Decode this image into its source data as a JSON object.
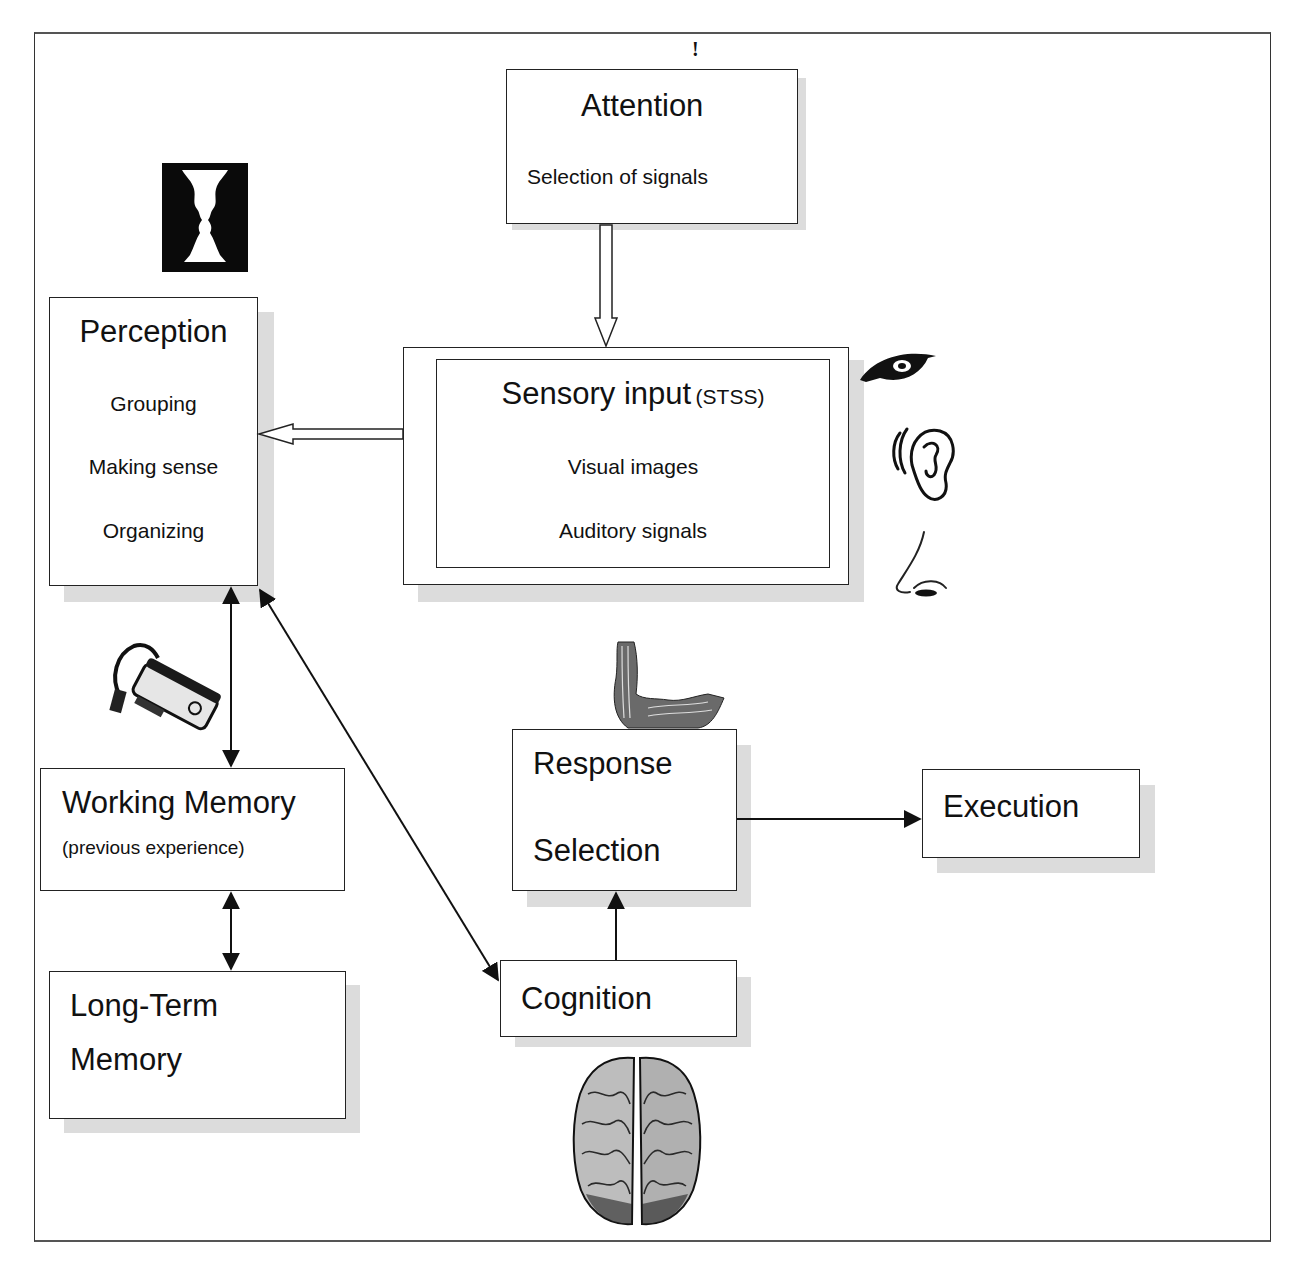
{
  "diagram": {
    "marker": "!",
    "nodes": {
      "attention": {
        "title": "Attention",
        "lines": [
          "Selection of signals"
        ]
      },
      "perception": {
        "title": "Perception",
        "lines": [
          "Grouping",
          "Making sense",
          "Organizing"
        ]
      },
      "sensory_input": {
        "title": "Sensory input",
        "title_suffix": "(STSS)",
        "lines": [
          "Visual images",
          "Auditory signals"
        ]
      },
      "working_memory": {
        "title": "Working Memory",
        "lines": [
          "(previous experience)"
        ]
      },
      "long_term_memory": {
        "title_lines": [
          "Long-Term",
          "Memory"
        ]
      },
      "response_selection": {
        "title_lines": [
          "Response",
          "Selection"
        ]
      },
      "execution": {
        "title": "Execution"
      },
      "cognition": {
        "title": "Cognition"
      }
    },
    "edges": [
      {
        "from": "attention",
        "to": "sensory_input",
        "style": "hollow-arrow"
      },
      {
        "from": "sensory_input",
        "to": "perception",
        "style": "hollow-arrow"
      },
      {
        "from": "perception",
        "to": "working_memory",
        "style": "double-headed"
      },
      {
        "from": "working_memory",
        "to": "long_term_memory",
        "style": "double-headed"
      },
      {
        "from": "perception",
        "to": "cognition",
        "style": "double-headed"
      },
      {
        "from": "cognition",
        "to": "response_selection",
        "style": "arrow"
      },
      {
        "from": "response_selection",
        "to": "execution",
        "style": "arrow"
      }
    ],
    "images": [
      {
        "name": "rubin-vase-faces",
        "near": "perception"
      },
      {
        "name": "eye",
        "near": "sensory_input"
      },
      {
        "name": "ear",
        "near": "sensory_input"
      },
      {
        "name": "nose",
        "near": "sensory_input"
      },
      {
        "name": "usb-card-reader",
        "near": "working_memory"
      },
      {
        "name": "flexed-arm-muscle",
        "near": "response_selection"
      },
      {
        "name": "brain",
        "near": "cognition"
      }
    ]
  }
}
